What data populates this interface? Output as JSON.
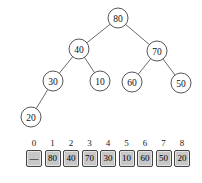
{
  "diagram": {
    "kind": "binary-heap-tree",
    "tree": {
      "node_radius": 10,
      "node_fill": "#ffffff",
      "node_stroke": "#565656",
      "edge_color": "#6b6b6b",
      "nodes": [
        {
          "value": "80",
          "x": 118,
          "y": 18
        },
        {
          "value": "40",
          "x": 79,
          "y": 49
        },
        {
          "value": "70",
          "x": 157,
          "y": 51
        },
        {
          "value": "30",
          "x": 53,
          "y": 81
        },
        {
          "value": "10",
          "x": 100,
          "y": 81
        },
        {
          "value": "60",
          "x": 132,
          "y": 82
        },
        {
          "value": "50",
          "x": 181,
          "y": 83
        },
        {
          "value": "20",
          "x": 31,
          "y": 117
        }
      ],
      "edges": [
        [
          0,
          1
        ],
        [
          0,
          2
        ],
        [
          1,
          3
        ],
        [
          1,
          4
        ],
        [
          2,
          5
        ],
        [
          2,
          6
        ],
        [
          3,
          7
        ]
      ]
    },
    "array": {
      "indices": [
        "0",
        "1",
        "2",
        "3",
        "4",
        "5",
        "6",
        "7",
        "8"
      ],
      "cells": [
        "—",
        "80",
        "40",
        "70",
        "30",
        "10",
        "60",
        "50",
        "20"
      ],
      "cell_fill": "#c7c7c7",
      "cell_border": "#454545"
    }
  }
}
